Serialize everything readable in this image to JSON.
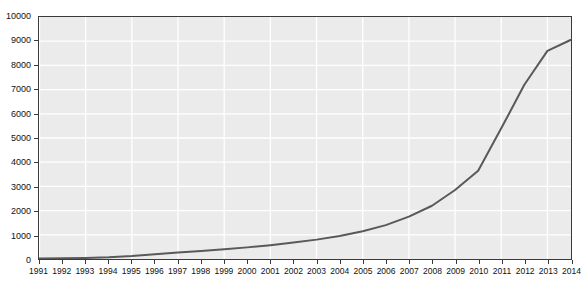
{
  "chart_data": {
    "type": "line",
    "title": "",
    "xlabel": "",
    "ylabel": "",
    "categories": [
      "1991",
      "1992",
      "1993",
      "1994",
      "1995",
      "1996",
      "1997",
      "1998",
      "1999",
      "2000",
      "2001",
      "2002",
      "2003",
      "2004",
      "2005",
      "2006",
      "2007",
      "2008",
      "2009",
      "2010",
      "2011",
      "2012",
      "2013",
      "2014"
    ],
    "values": [
      20,
      30,
      45,
      70,
      120,
      200,
      270,
      330,
      400,
      480,
      570,
      680,
      800,
      950,
      1150,
      1400,
      1750,
      2200,
      2850,
      3650,
      5400,
      7200,
      8600,
      9050
    ],
    "series": [
      {
        "name": "series-1",
        "color": "#595959",
        "values": [
          20,
          30,
          45,
          70,
          120,
          200,
          270,
          330,
          400,
          480,
          570,
          680,
          800,
          950,
          1150,
          1400,
          1750,
          2200,
          2850,
          3650,
          5400,
          7200,
          8600,
          9050
        ]
      }
    ],
    "ylim": [
      0,
      10000
    ],
    "ytick_step": 1000,
    "ytick_labels": [
      "0",
      "1000",
      "2000",
      "3000",
      "4000",
      "5000",
      "6000",
      "7000",
      "8000",
      "9000",
      "10000"
    ],
    "grid": true,
    "grid_color": "#ffffff",
    "plot_background": "#ebebeb",
    "axis_color": "#3a3a3a",
    "legend": "none"
  }
}
